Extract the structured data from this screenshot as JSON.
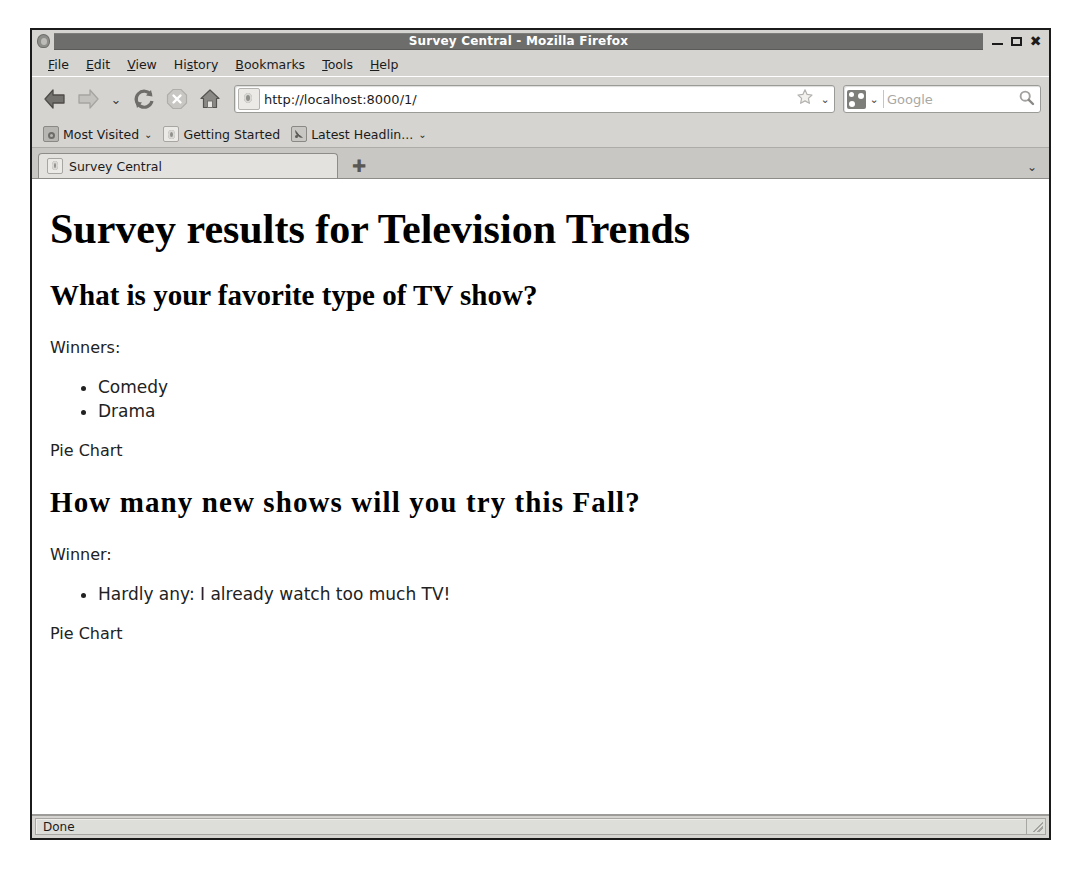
{
  "window": {
    "title": "Survey Central - Mozilla Firefox",
    "app_icon": "globe-icon",
    "controls": {
      "minimize": "minimize-icon",
      "maximize": "maximize-icon",
      "close": "✖"
    }
  },
  "menubar": {
    "items": [
      {
        "pre": "",
        "accel": "F",
        "post": "ile"
      },
      {
        "pre": "",
        "accel": "E",
        "post": "dit"
      },
      {
        "pre": "",
        "accel": "V",
        "post": "iew"
      },
      {
        "pre": "Hi",
        "accel": "s",
        "post": "tory"
      },
      {
        "pre": "",
        "accel": "B",
        "post": "ookmarks"
      },
      {
        "pre": "",
        "accel": "T",
        "post": "ools"
      },
      {
        "pre": "",
        "accel": "H",
        "post": "elp"
      }
    ]
  },
  "toolbar": {
    "back": "back-icon",
    "forward": "forward-icon",
    "history_dropdown": "⌄",
    "reload": "reload-icon",
    "stop": "stop-icon",
    "home": "home-icon",
    "url": "http://localhost:8000/1/",
    "url_placeholder": "Search or enter address",
    "bookmark_star": "star-icon",
    "url_dropdown": "⌄",
    "search_engine_dropdown": "⌄",
    "search_placeholder": "Google",
    "search_value": ""
  },
  "bookmarks": {
    "items": [
      {
        "label": "Most Visited",
        "icon": "folder-icon",
        "chevron": "⌄"
      },
      {
        "label": "Getting Started",
        "icon": "document-icon",
        "chevron": ""
      },
      {
        "label": "Latest Headlin...",
        "icon": "feed-icon",
        "chevron": "⌄"
      }
    ]
  },
  "tabs": {
    "items": [
      {
        "label": "Survey Central",
        "favicon": "document-icon"
      }
    ],
    "new_tab_glyph": "✚",
    "list_all_tabs_glyph": "⌄"
  },
  "page": {
    "h1": "Survey results for Television Trends",
    "questions": [
      {
        "heading": "What is your favorite type of TV show?",
        "winners_label": "Winners:",
        "winners": [
          "Comedy",
          "Drama"
        ],
        "chart_label": "Pie Chart"
      },
      {
        "heading": "How many new shows will you try this Fall?",
        "winners_label": "Winner:",
        "winners": [
          "Hardly any: I already watch too much TV!"
        ],
        "chart_label": "Pie Chart"
      }
    ]
  },
  "statusbar": {
    "text": "Done",
    "grip": "resize-grip-icon"
  },
  "colors": {
    "chrome": "#d6d4d0",
    "titlebar_strip": "#6d6d6b",
    "page_bg": "#ffffff",
    "text": "#1b1b1b",
    "border": "#1b1b1b"
  }
}
